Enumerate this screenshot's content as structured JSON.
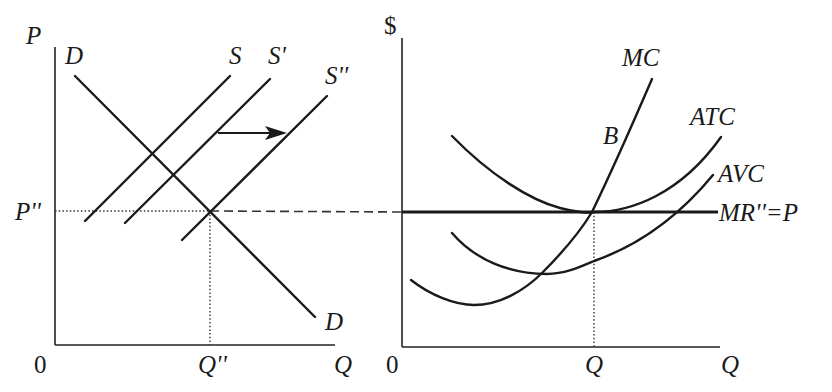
{
  "left_panel": {
    "y_axis_label": "P",
    "x_axis_label": "Q",
    "origin_label": "0",
    "price_label": "P''",
    "quantity_label": "Q''",
    "curves": {
      "demand_top_label": "D",
      "demand_bottom_label": "D",
      "supply_label": "S",
      "supply_prime_label": "S'",
      "supply_double_prime_label": "S''"
    },
    "shift_arrow": "supply shift right"
  },
  "right_panel": {
    "y_axis_label": "$",
    "x_axis_label": "Q",
    "origin_label": "0",
    "quantity_label": "Q",
    "curves": {
      "mc_label": "MC",
      "atc_label": "ATC",
      "avc_label": "AVC",
      "mr_label": "MR''=P",
      "point_label": "B"
    }
  },
  "colors": {
    "line": "#1a1a1a",
    "background": "#ffffff"
  }
}
